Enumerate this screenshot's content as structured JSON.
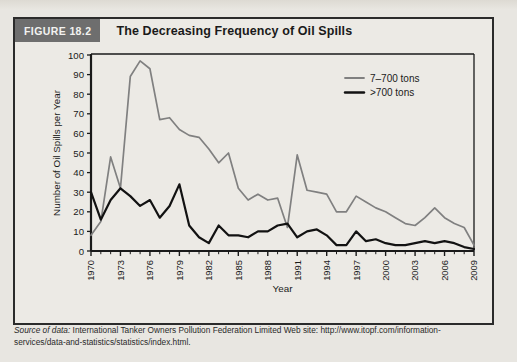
{
  "figure": {
    "badge": "FIGURE 18.2",
    "title": "The Decreasing Frequency of Oil Spills"
  },
  "source": {
    "label": "Source of data:",
    "text": "International Tanker Owners Pollution Federation Limited Web site: http://www.itopf.com/information-services/data-and-statistics/statistics/index.html."
  },
  "colors": {
    "series_small": "#808080",
    "series_large": "#121212",
    "axis": "#1a1a1a",
    "badge_bg": "#6e6e6e",
    "card_bg": "#eceae5",
    "page_bg": "#e8e6e1"
  },
  "chart_data": {
    "type": "line",
    "title": "The Decreasing Frequency of Oil Spills",
    "xlabel": "Year",
    "ylabel": "Number of Oil Spills per Year",
    "xlim": [
      1970,
      2009
    ],
    "ylim": [
      0,
      100
    ],
    "ytick_step": 10,
    "yticks": [
      0,
      10,
      20,
      30,
      40,
      50,
      60,
      70,
      80,
      90,
      100
    ],
    "xtick_labels": [
      "1970",
      "1973",
      "1976",
      "1979",
      "1982",
      "1985",
      "1988",
      "1991",
      "1994",
      "1997",
      "2000",
      "2003",
      "2006",
      "2009"
    ],
    "xtick_values": [
      1970,
      1973,
      1976,
      1979,
      1982,
      1985,
      1988,
      1991,
      1994,
      1997,
      2000,
      2003,
      2006,
      2009
    ],
    "xtick_minor_step": 1,
    "grid": false,
    "legend_position": "top-right",
    "x": [
      1970,
      1971,
      1972,
      1973,
      1974,
      1975,
      1976,
      1977,
      1978,
      1979,
      1980,
      1981,
      1982,
      1983,
      1984,
      1985,
      1986,
      1987,
      1988,
      1989,
      1990,
      1991,
      1992,
      1993,
      1994,
      1995,
      1996,
      1997,
      1998,
      1999,
      2000,
      2001,
      2002,
      2003,
      2004,
      2005,
      2006,
      2007,
      2008,
      2009
    ],
    "series": [
      {
        "name": "7–700 tons",
        "color": "#808080",
        "values": [
          8,
          15,
          48,
          32,
          89,
          97,
          93,
          67,
          68,
          62,
          59,
          58,
          52,
          45,
          50,
          32,
          26,
          29,
          26,
          27,
          12,
          49,
          31,
          30,
          29,
          20,
          20,
          28,
          25,
          22,
          20,
          17,
          14,
          13,
          17,
          22,
          17,
          14,
          12,
          3
        ]
      },
      {
        "name": ">700 tons",
        "color": "#121212",
        "values": [
          30,
          16,
          26,
          32,
          28,
          23,
          26,
          17,
          23,
          34,
          13,
          7,
          4,
          13,
          8,
          8,
          7,
          10,
          10,
          13,
          14,
          7,
          10,
          11,
          8,
          3,
          3,
          10,
          5,
          6,
          4,
          3,
          3,
          4,
          5,
          4,
          5,
          4,
          2,
          1
        ]
      }
    ],
    "legend": [
      {
        "label": "7–700 tons",
        "color": "#808080"
      },
      {
        "label": ">700 tons",
        "color": "#121212"
      }
    ]
  }
}
